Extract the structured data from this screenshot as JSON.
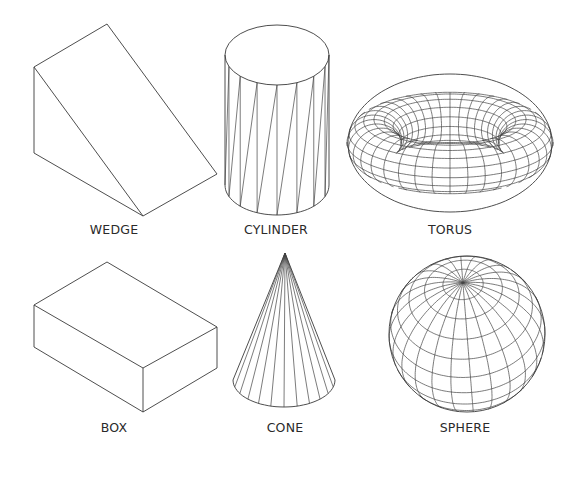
{
  "figure": {
    "background": "#ffffff",
    "line_color": "#3a3a3a",
    "shapes": [
      {
        "id": "wedge",
        "label": "WEDGE"
      },
      {
        "id": "cylinder",
        "label": "CYLINDER"
      },
      {
        "id": "torus",
        "label": "TORUS"
      },
      {
        "id": "box",
        "label": "BOX"
      },
      {
        "id": "cone",
        "label": "CONE"
      },
      {
        "id": "sphere",
        "label": "SPHERE"
      }
    ]
  }
}
